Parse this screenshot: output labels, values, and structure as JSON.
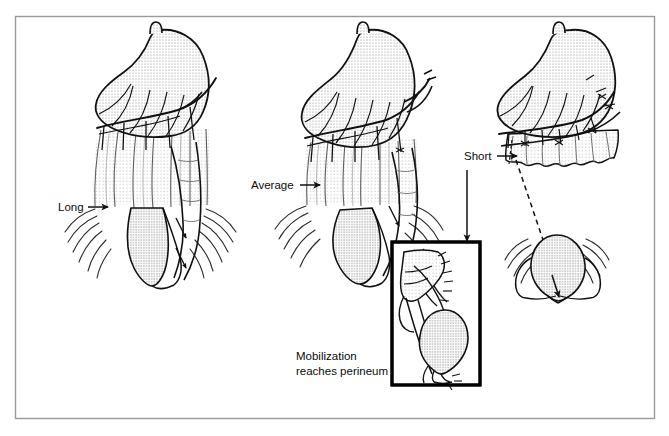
{
  "figure": {
    "type": "medical-illustration",
    "background_color": "#ffffff",
    "frame": {
      "name": "outer-frame",
      "color": "#9a9a9a",
      "x": 15,
      "y": 16,
      "width": 640,
      "height": 403
    },
    "panels": [
      {
        "id": "panel-long",
        "label": "Long",
        "label_x": 58,
        "label_y": 211,
        "arrow_from_x": 88,
        "arrow_to_x": 108,
        "arrow_y": 207,
        "center_x": 150,
        "mesentery_length": "long",
        "description": "Long mesentery, bowel reaches deep into pelvis"
      },
      {
        "id": "panel-average",
        "label": "Average",
        "label_x": 251,
        "label_y": 189,
        "arrow_from_x": 300,
        "arrow_to_x": 320,
        "arrow_y": 185,
        "center_x": 360,
        "mesentery_length": "average",
        "description": "Average mesentery length"
      },
      {
        "id": "panel-short",
        "label": "Short",
        "label_x": 464,
        "label_y": 160,
        "arrow_from_x": 497,
        "arrow_to_x": 517,
        "arrow_y": 156,
        "center_x": 565,
        "mesentery_length": "short",
        "description": "Short mesentery, bowel does not reach perineum"
      }
    ],
    "pointer_arrow": {
      "name": "short-to-inset-arrow",
      "x": 467,
      "y_start": 170,
      "y_end": 241,
      "direction": "down",
      "color": "#111111"
    },
    "inset": {
      "name": "mobilization-inset",
      "x": 392,
      "y": 242,
      "width": 88,
      "height": 143,
      "border_color": "#000000",
      "border_width": 3,
      "caption_line1": "Mobilization",
      "caption_line2": "reaches perineum",
      "caption_x": 296,
      "caption_y1": 360,
      "caption_y2": 375
    },
    "colors": {
      "ink": "#111111",
      "stipple": "#8f8f8f",
      "hatch": "#5b5b5b",
      "frame": "#9a9a9a",
      "white": "#ffffff"
    }
  }
}
